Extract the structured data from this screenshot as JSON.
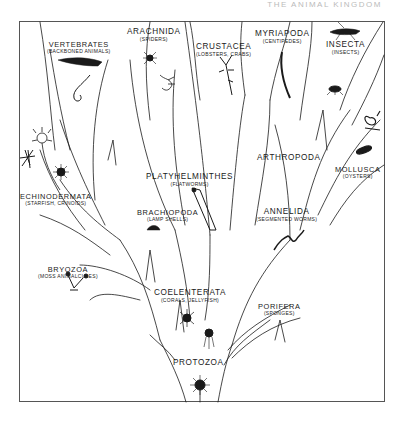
{
  "header": {
    "text": "THE ANIMAL KINGDOM"
  },
  "diagram": {
    "root": "PROTOZOA",
    "nodes": [
      {
        "id": "vertebrates",
        "name": "VERTEBRATES",
        "common": "(BACKBONED ANIMALS)"
      },
      {
        "id": "arachnida",
        "name": "ARACHNIDA",
        "common": "(SPIDERS)"
      },
      {
        "id": "crustacea",
        "name": "CRUSTACEA",
        "common": "(LOBSTERS, CRABS)"
      },
      {
        "id": "myriapoda",
        "name": "MYRIAPODA",
        "common": "(CENTIPEDES)"
      },
      {
        "id": "insecta",
        "name": "INSECTA",
        "common": "(INSECTS)"
      },
      {
        "id": "arthropoda",
        "name": "ARTHROPODA",
        "common": ""
      },
      {
        "id": "mollusca",
        "name": "MOLLUSCA",
        "common": "(OYSTERS)"
      },
      {
        "id": "echinodermata",
        "name": "ECHINODERMATA",
        "common": "(STARFISH, CRINOIDS)"
      },
      {
        "id": "platyhelminthes",
        "name": "PLATYHELMINTHES",
        "common": "(FLATWORMS)"
      },
      {
        "id": "brachiopoda",
        "name": "BRACHIOPODA",
        "common": "(LAMP SHELLS)"
      },
      {
        "id": "annelida",
        "name": "ANNELIDA",
        "common": "(SEGMENTED WORMS)"
      },
      {
        "id": "bryozoa",
        "name": "BRYOZOA",
        "common": "(MOSS ANIMALCULES)"
      },
      {
        "id": "coelenterata",
        "name": "COELENTERATA",
        "common": "(CORALS, JELLYFISH)"
      },
      {
        "id": "porifera",
        "name": "PORIFERA",
        "common": "(SPONGES)"
      },
      {
        "id": "protozoa",
        "name": "PROTOZOA",
        "common": ""
      }
    ],
    "edges": [
      [
        "protozoa",
        "coelenterata"
      ],
      [
        "protozoa",
        "porifera"
      ],
      [
        "coelenterata",
        "bryozoa"
      ],
      [
        "coelenterata",
        "brachiopoda"
      ],
      [
        "coelenterata",
        "platyhelminthes"
      ],
      [
        "coelenterata",
        "annelida"
      ],
      [
        "bryozoa",
        "echinodermata"
      ],
      [
        "echinodermata",
        "vertebrates"
      ],
      [
        "annelida",
        "arthropoda"
      ],
      [
        "annelida",
        "mollusca"
      ],
      [
        "arthropoda",
        "arachnida"
      ],
      [
        "arthropoda",
        "crustacea"
      ],
      [
        "arthropoda",
        "myriapoda"
      ],
      [
        "arthropoda",
        "insecta"
      ]
    ],
    "illustrations": [
      "fish",
      "snake-like-chordate",
      "starfish",
      "crinoid",
      "sea-urchin",
      "spider",
      "scorpion",
      "lobster",
      "centipede",
      "grasshopper",
      "ant",
      "snail",
      "oyster",
      "flatworm",
      "lamp-shell",
      "earthworm",
      "bryozoan",
      "coral-polyp",
      "jellyfish",
      "radiolarian"
    ],
    "colors": {
      "ink": "#1a1a1a",
      "paper": "#ffffff",
      "frame": "#555555"
    }
  }
}
